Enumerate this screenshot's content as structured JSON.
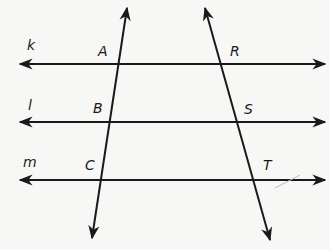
{
  "diagram": {
    "line_labels": {
      "k": "k",
      "l": "l",
      "m": "m"
    },
    "point_labels": {
      "A": "A",
      "B": "B",
      "C": "C",
      "R": "R",
      "S": "S",
      "T": "T"
    },
    "colors": {
      "stroke": "#1a1a1a",
      "background": "#f7f7f5"
    }
  }
}
